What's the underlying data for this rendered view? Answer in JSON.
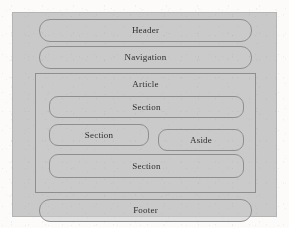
{
  "diagram": {
    "background_color": "#c9c9c9",
    "stroke_color": "#8e8e8e",
    "text_color": "#2e2e2e",
    "regions": {
      "header": {
        "label": "Header"
      },
      "navigation": {
        "label": "Navigation"
      },
      "article": {
        "label": "Article",
        "children": {
          "section_top": {
            "label": "Section"
          },
          "section_middle": {
            "label": "Section"
          },
          "aside": {
            "label": "Aside"
          },
          "section_bottom": {
            "label": "Section"
          }
        }
      },
      "footer": {
        "label": "Footer"
      }
    }
  }
}
